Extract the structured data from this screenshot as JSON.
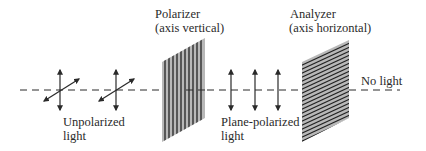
{
  "diagram": {
    "beam": {
      "y": 90,
      "x_start": 20,
      "x_end": 400,
      "style": "dashed"
    },
    "labels": {
      "polarizer_line1": "Polarizer",
      "polarizer_line2": "(axis vertical)",
      "analyzer_line1": "Analyzer",
      "analyzer_line2": "(axis horizontal)",
      "unpolarized_line1": "Unpolarized",
      "unpolarized_line2": "light",
      "plane_polarized_line1": "Plane-polarized",
      "plane_polarized_line2": "light",
      "output": "No light"
    },
    "elements": [
      {
        "name": "unpolarized-light",
        "symbols": 2,
        "orientation": "vertical + diagonal"
      },
      {
        "name": "polarizer",
        "axis": "vertical",
        "stripe_direction": "vertical"
      },
      {
        "name": "plane-polarized-light",
        "symbols": 3,
        "orientation": "vertical"
      },
      {
        "name": "analyzer",
        "axis": "horizontal",
        "stripe_direction": "horizontal"
      },
      {
        "name": "output",
        "result": "No light"
      }
    ],
    "colors": {
      "line": "#2a2a2a",
      "filter_fill": "#b8b8b8",
      "stripe": "#222222",
      "text": "#2a2a2a"
    }
  }
}
